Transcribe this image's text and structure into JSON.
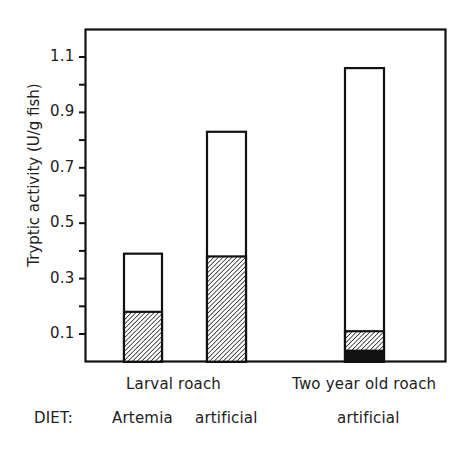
{
  "chart_data": {
    "type": "bar",
    "stacked": true,
    "title": "",
    "xlabel": "",
    "ylabel": "Tryptic activity  (U/g fish)",
    "ylim": [
      0,
      1.2
    ],
    "yticks": [
      0.1,
      0.2,
      0.3,
      0.4,
      0.5,
      0.6,
      0.7,
      0.8,
      0.9,
      1.0,
      1.1
    ],
    "ytick_labels": [
      "0.1",
      "0.3",
      "0.5",
      "0.7",
      "0.9",
      "1.1"
    ],
    "grid": false,
    "legend": null,
    "group_labels": [
      "Larval  roach",
      "Two year old  roach"
    ],
    "diet_label": "DIET:",
    "categories": [
      "Artemia",
      "artificial",
      "artificial"
    ],
    "groups_of_categories": [
      "Larval roach",
      "Larval roach",
      "Two year old roach"
    ],
    "totals": [
      0.39,
      0.83,
      1.06
    ],
    "series": [
      {
        "name": "solid (black) portion",
        "pattern": "solid-black",
        "values": [
          0.0,
          0.0,
          0.04
        ]
      },
      {
        "name": "hatched portion",
        "pattern": "diagonal-hatch",
        "values": [
          0.18,
          0.38,
          0.07
        ]
      },
      {
        "name": "open (white) portion",
        "pattern": "open",
        "values": [
          0.21,
          0.45,
          0.95
        ]
      }
    ],
    "cumulative_tops": {
      "solid": [
        0.0,
        0.0,
        0.04
      ],
      "hatched": [
        0.18,
        0.38,
        0.11
      ],
      "total": [
        0.39,
        0.83,
        1.06
      ]
    }
  },
  "labels": {
    "ylabel": "Tryptic activity  (U/g fish)",
    "yticks": [
      "1.1",
      "0.9",
      "0.7",
      "0.5",
      "0.3",
      "0.1"
    ],
    "group1": "Larval  roach",
    "group2": "Two year old  roach",
    "diet": "DIET:",
    "cat1": "Artemia",
    "cat2": "artificial",
    "cat3": "artificial"
  }
}
